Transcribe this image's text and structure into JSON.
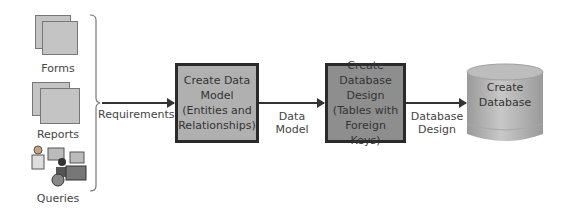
{
  "inputs": [
    {
      "label": "Forms",
      "icon": "forms-document-icon"
    },
    {
      "label": "Reports",
      "icon": "reports-document-icon"
    },
    {
      "label": "Queries",
      "icon": "queries-users-icon"
    }
  ],
  "flow": {
    "edge1_label": "Requirements",
    "step1": {
      "line1": "Create Data",
      "line2": "Model",
      "line3": "(Entities and",
      "line4": "Relationships)"
    },
    "edge2_label_line1": "Data",
    "edge2_label_line2": "Model",
    "step2": {
      "line1": "Create",
      "line2": "Database",
      "line3": "Design",
      "line4": "(Tables with",
      "line5": "Foreign Keys)"
    },
    "edge3_label_line1": "Database",
    "edge3_label_line2": "Design",
    "step3": {
      "line1": "Create",
      "line2": "Database"
    }
  },
  "colors": {
    "step1_fill": "#b0b0b0",
    "step2_fill": "#8e8e8e",
    "cylinder_fill": "#b8b8b8",
    "border": "#2a2a2a"
  }
}
